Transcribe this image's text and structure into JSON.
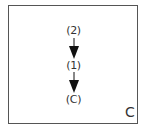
{
  "diagram": {
    "nodes": [
      {
        "id": "n2",
        "label": "(2)"
      },
      {
        "id": "n1",
        "label": "(1)"
      },
      {
        "id": "nC",
        "label": "(C)"
      }
    ],
    "edges": [
      {
        "from": "n2",
        "to": "n1"
      },
      {
        "from": "n1",
        "to": "nC"
      }
    ],
    "corner_label": "C",
    "colors": {
      "border": "#555555",
      "arrow": "#111111",
      "text": "#333333"
    }
  }
}
